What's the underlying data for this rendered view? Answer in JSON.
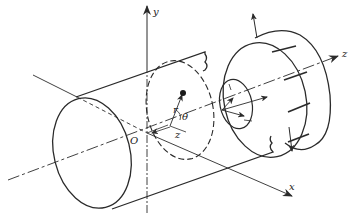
{
  "diagram": {
    "labels": {
      "y_axis": "y",
      "x_axis": "x",
      "z_axis": "z",
      "origin": "O",
      "radius": "r",
      "angle": "θ",
      "axial_distance": "z"
    },
    "colors": {
      "ink": "#2a2a2a",
      "background": "#ffffff"
    }
  }
}
